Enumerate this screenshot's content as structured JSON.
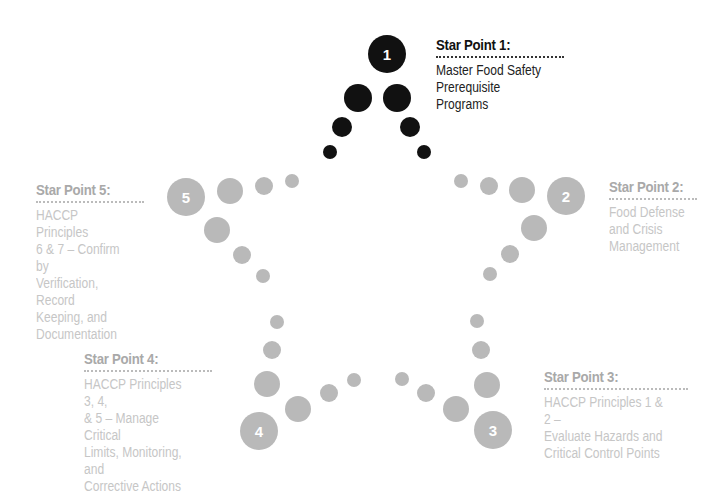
{
  "diagram": {
    "colors": {
      "active_dot": "#111111",
      "inactive_dot": "#b9b9b9",
      "active_title": "#111111",
      "active_body": "#222222",
      "inactive_title": "#a9a9a9",
      "inactive_body": "#c6c6c6",
      "active_rule": "#333333",
      "inactive_rule": "#bbbbbb"
    },
    "star_points": [
      {
        "number": "1",
        "title": "Star Point 1:",
        "body": "Master Food Safety\nPrerequisite Programs",
        "active": true
      },
      {
        "number": "2",
        "title": "Star Point 2:",
        "body": "Food Defense\nand Crisis\nManagement",
        "active": false
      },
      {
        "number": "3",
        "title": "Star Point 3:",
        "body": "HACCP Principles 1 & 2 –\nEvaluate Hazards and\nCritical Control Points",
        "active": false
      },
      {
        "number": "4",
        "title": "Star Point 4:",
        "body": "HACCP Principles 3, 4,\n& 5 – Manage Critical\nLimits, Monitoring, and\nCorrective Actions",
        "active": false
      },
      {
        "number": "5",
        "title": "Star Point 5:",
        "body": "HACCP Principles\n6 & 7 – Confirm by\nVerification, Record\nKeeping, and\nDocumentation",
        "active": false
      }
    ]
  }
}
